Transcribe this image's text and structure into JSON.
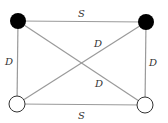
{
  "diagram": {
    "type": "complete-graph-k4",
    "colors": {
      "edge": "#9a9a9a",
      "filled_node": "#000000",
      "empty_node_fill": "#ffffff",
      "empty_node_stroke": "#333333",
      "label": "#333333"
    },
    "nodes": [
      {
        "id": "top-left",
        "fill": "black"
      },
      {
        "id": "top-right",
        "fill": "black"
      },
      {
        "id": "bottom-left",
        "fill": "white"
      },
      {
        "id": "bottom-right",
        "fill": "white"
      }
    ],
    "edges": [
      {
        "from": "top-left",
        "to": "top-right",
        "label": "S"
      },
      {
        "from": "bottom-left",
        "to": "bottom-right",
        "label": "S"
      },
      {
        "from": "top-left",
        "to": "bottom-left",
        "label": "D"
      },
      {
        "from": "top-right",
        "to": "bottom-right",
        "label": "D"
      },
      {
        "from": "bottom-left",
        "to": "top-right",
        "label": "D"
      },
      {
        "from": "top-left",
        "to": "bottom-right",
        "label": "D"
      }
    ]
  }
}
